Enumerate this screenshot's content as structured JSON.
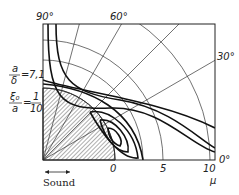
{
  "diagram": {
    "angle_labels": [
      "90°",
      "60°",
      "30°",
      "0°"
    ],
    "mu_ticks": [
      "0",
      "5",
      "10"
    ],
    "mu_axis_label": "μ",
    "param_1": {
      "numerator": "a",
      "denominator": "δ",
      "value": "7,1"
    },
    "param_2": {
      "numerator": "ξ₀",
      "denominator": "a",
      "value_num": "1",
      "value_den": "10"
    },
    "sound_label": "Sound",
    "colors": {
      "ink": "#111111",
      "hatch": "#333333",
      "background": "#ffffff"
    }
  }
}
